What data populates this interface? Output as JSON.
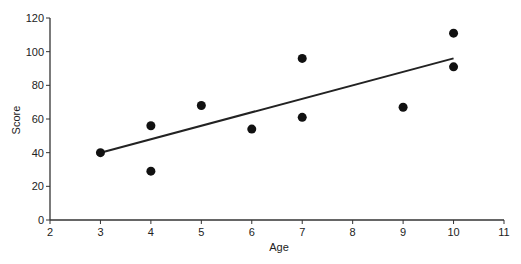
{
  "chart_data": {
    "type": "scatter",
    "title": "",
    "xlabel": "Age",
    "ylabel": "Score",
    "xlim": [
      2,
      11
    ],
    "ylim": [
      0,
      120
    ],
    "x_ticks": [
      2,
      3,
      4,
      5,
      6,
      7,
      8,
      9,
      10,
      11
    ],
    "y_ticks": [
      0,
      20,
      40,
      60,
      80,
      100,
      120
    ],
    "grid": false,
    "legend": null,
    "series": [
      {
        "name": "observations",
        "points": [
          {
            "x": 3,
            "y": 40
          },
          {
            "x": 4,
            "y": 56
          },
          {
            "x": 4,
            "y": 29
          },
          {
            "x": 5,
            "y": 68
          },
          {
            "x": 6,
            "y": 54
          },
          {
            "x": 7,
            "y": 96
          },
          {
            "x": 7,
            "y": 61
          },
          {
            "x": 9,
            "y": 67
          },
          {
            "x": 10,
            "y": 111
          },
          {
            "x": 10,
            "y": 91
          }
        ]
      }
    ],
    "trend_line": {
      "x": [
        3,
        10
      ],
      "y": [
        40,
        96
      ]
    },
    "colors": {
      "points": "#111111",
      "line": "#222222",
      "axis": "#333333"
    }
  }
}
